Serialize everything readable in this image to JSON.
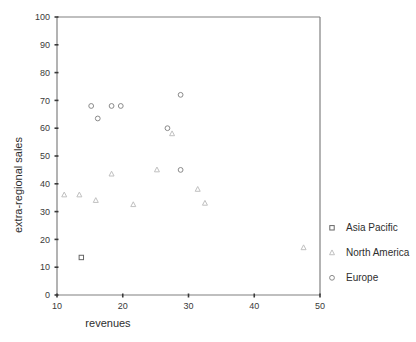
{
  "chart_data": {
    "type": "scatter",
    "title": "",
    "xlabel": "revenues",
    "ylabel": "extra-regional sales",
    "xlim": [
      10,
      50
    ],
    "ylim": [
      0,
      100
    ],
    "xticks": [
      10,
      20,
      30,
      40,
      50
    ],
    "yticks": [
      0,
      10,
      20,
      30,
      40,
      50,
      60,
      70,
      80,
      90,
      100
    ],
    "xtick_labels": [
      "10",
      "20",
      "30",
      "40",
      "50"
    ],
    "ytick_labels": [
      "0",
      "10",
      "20",
      "30",
      "40",
      "50",
      "60",
      "70",
      "80",
      "90",
      "100"
    ],
    "grid": false,
    "legend_position": "right",
    "series": [
      {
        "name": "Asia Pacific",
        "marker": "square",
        "color": "#666666",
        "points": [
          {
            "x": 13.7,
            "y": 13.5
          }
        ]
      },
      {
        "name": "North America",
        "marker": "triangle",
        "color": "#c0c0c0",
        "points": [
          {
            "x": 11.1,
            "y": 36.0
          },
          {
            "x": 13.4,
            "y": 36.0
          },
          {
            "x": 15.9,
            "y": 34.0
          },
          {
            "x": 18.3,
            "y": 43.5
          },
          {
            "x": 21.6,
            "y": 32.5
          },
          {
            "x": 25.2,
            "y": 45.0
          },
          {
            "x": 27.5,
            "y": 58.0
          },
          {
            "x": 31.4,
            "y": 38.0
          },
          {
            "x": 32.5,
            "y": 33.0
          },
          {
            "x": 47.5,
            "y": 17.0
          }
        ]
      },
      {
        "name": "Europe",
        "marker": "circle",
        "color": "#8a8a8a",
        "points": [
          {
            "x": 15.2,
            "y": 68.0
          },
          {
            "x": 16.2,
            "y": 63.5
          },
          {
            "x": 18.3,
            "y": 68.0
          },
          {
            "x": 19.7,
            "y": 68.0
          },
          {
            "x": 26.8,
            "y": 60.0
          },
          {
            "x": 28.8,
            "y": 72.0
          },
          {
            "x": 28.8,
            "y": 45.0
          }
        ]
      }
    ]
  },
  "legend": {
    "items": [
      {
        "label": "Asia Pacific",
        "marker": "square"
      },
      {
        "label": "North America",
        "marker": "triangle"
      },
      {
        "label": "Europe",
        "marker": "circle"
      }
    ]
  },
  "axes": {
    "x_title": "revenues",
    "y_title": "extra-regional sales"
  }
}
